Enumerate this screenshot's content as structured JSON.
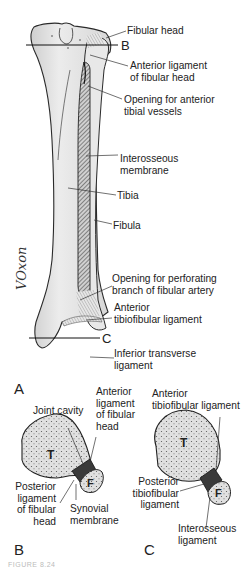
{
  "figure": {
    "panels": {
      "A": {
        "letter": "A",
        "section_markers": {
          "upper": "B",
          "lower": "C"
        },
        "labels": {
          "fibular_head": "Fibular head",
          "anterior_ligament_fibular_head": [
            "Anterior ligament",
            "of fibular head"
          ],
          "opening_anterior_tibial_vessels": [
            "Opening for anterior",
            "tibial vessels"
          ],
          "interosseous_membrane": [
            "Interosseous",
            "membrane"
          ],
          "tibia": "Tibia",
          "fibula": "Fibula",
          "opening_perforating_branch": [
            "Opening for perforating",
            "branch of fibular artery"
          ],
          "anterior_tibiofibular_ligament": [
            "Anterior",
            "tibiofibular ligament"
          ],
          "inferior_transverse_ligament": [
            "Inferior transverse",
            "ligament"
          ]
        },
        "signature": "VOxon"
      },
      "B": {
        "letter": "B",
        "bone_letters": {
          "tibia": "T",
          "fibula": "F"
        },
        "labels": {
          "joint_cavity": "Joint cavity",
          "anterior_ligament_fibular_head": [
            "Anterior",
            "ligament",
            "of fibular",
            "head"
          ],
          "posterior_ligament_fibular_head": [
            "Posterior",
            "ligament",
            "of fibular",
            "head"
          ],
          "synovial_membrane": [
            "Synovial",
            "membrane"
          ]
        }
      },
      "C": {
        "letter": "C",
        "bone_letters": {
          "tibia": "T",
          "fibula": "F"
        },
        "labels": {
          "anterior_tibiofibular_ligament": [
            "Anterior",
            "tibiofibular ligament"
          ],
          "posterior_tibiofibular_ligament": [
            "Posterior",
            "tibiofibular",
            "ligament"
          ],
          "interosseous_ligament": [
            "Interosseous",
            "ligament"
          ]
        }
      }
    },
    "caption": "FIGURE 8.24"
  },
  "colors": {
    "bone_fill": "#e2e2e2",
    "bone_shade": "#c4c4c4",
    "outline": "#2a2a2a",
    "membrane": "#555555",
    "background": "#ffffff"
  }
}
